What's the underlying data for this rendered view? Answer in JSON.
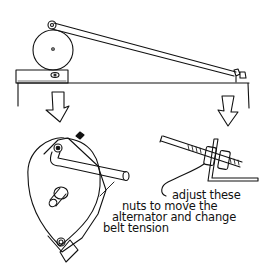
{
  "figure": {
    "type": "line-drawing",
    "colors": {
      "ink": "#111111",
      "background": "#ffffff"
    },
    "parts": {
      "top_view": [
        "alternator-pulley-wheel",
        "mounting-bracket-block",
        "adjusting-rod",
        "shelf-board",
        "end-bracket-nuts"
      ],
      "detail_left": "alternator-with-pivot-arm",
      "detail_right": "threaded-rod-with-nuts-and-bracket",
      "arrows": [
        "down-arrow-left",
        "down-arrow-right"
      ]
    },
    "annotation": {
      "line1": "adjust these",
      "line2": "nuts to move the",
      "line3": "alternator and change",
      "line4": "belt tension"
    }
  }
}
